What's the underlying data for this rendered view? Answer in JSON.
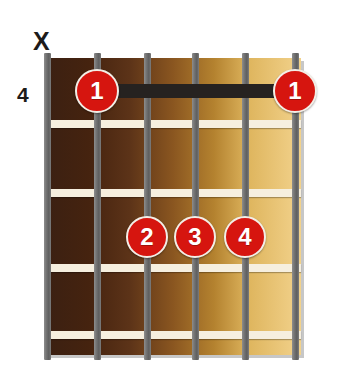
{
  "diagram": {
    "type": "guitar-chord-diagram",
    "position_label": "4",
    "strings_count": 6,
    "frets_count": 4,
    "board": {
      "x": 45,
      "y": 58,
      "width": 256,
      "height": 297,
      "gradient_from": "#3b2012",
      "gradient_to": "#f2d28c"
    },
    "string_positions_x": [
      47,
      97,
      147,
      195,
      245,
      295
    ],
    "string_color": "#6f6f6f",
    "fret_lines_y": [
      124,
      193,
      268,
      335
    ],
    "fret_line_color": "#f6efdf",
    "markers": [
      {
        "name": "mute-marker-string-1",
        "glyph": "X",
        "x": 33,
        "y": 29,
        "string": 1
      }
    ],
    "barres": [
      {
        "name": "barre-fret-1",
        "finger": "1",
        "from_string": 2,
        "to_string": 6,
        "fret": 1,
        "x": 97,
        "y": 84,
        "width": 198,
        "height": 14,
        "color": "#262220"
      }
    ],
    "finger_dots": [
      {
        "name": "finger-dot-1-left",
        "label": "1",
        "string": 2,
        "fret": 1,
        "cx": 97,
        "cy": 91,
        "r": 22
      },
      {
        "name": "finger-dot-1-right",
        "label": "1",
        "string": 6,
        "fret": 1,
        "cx": 295,
        "cy": 91,
        "r": 22
      },
      {
        "name": "finger-dot-2",
        "label": "2",
        "string": 3,
        "fret": 3,
        "cx": 147,
        "cy": 237,
        "r": 21
      },
      {
        "name": "finger-dot-3",
        "label": "3",
        "string": 4,
        "fret": 3,
        "cx": 195,
        "cy": 237,
        "r": 21
      },
      {
        "name": "finger-dot-4",
        "label": "4",
        "string": 5,
        "fret": 3,
        "cx": 245,
        "cy": 237,
        "r": 21
      }
    ],
    "colors": {
      "dot_fill": "#d6150f",
      "dot_text": "#ffffff",
      "dot_ring": "#f3eee6",
      "text": "#1d1b19",
      "background": "#ffffff"
    }
  }
}
